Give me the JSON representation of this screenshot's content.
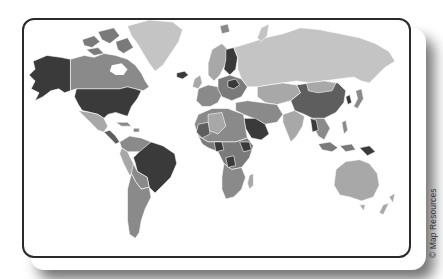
{
  "map": {
    "title": "World Map",
    "projection": "mercator",
    "style": "grayscale choropleth",
    "shades": {
      "ocean": "#ffffff",
      "darkest": "#3a3a3a",
      "dark": "#5e5e5e",
      "medium": "#8a8a8a",
      "light": "#a8a8a8",
      "lightest": "#c4c4c4",
      "border": "#ffffff"
    },
    "highlighted_dark_regions": [
      "Alaska",
      "United States",
      "Brazil",
      "Finland",
      "Saudi Arabia",
      "Papua New Guinea",
      "Iceland"
    ],
    "credit": "© Map Resources"
  }
}
